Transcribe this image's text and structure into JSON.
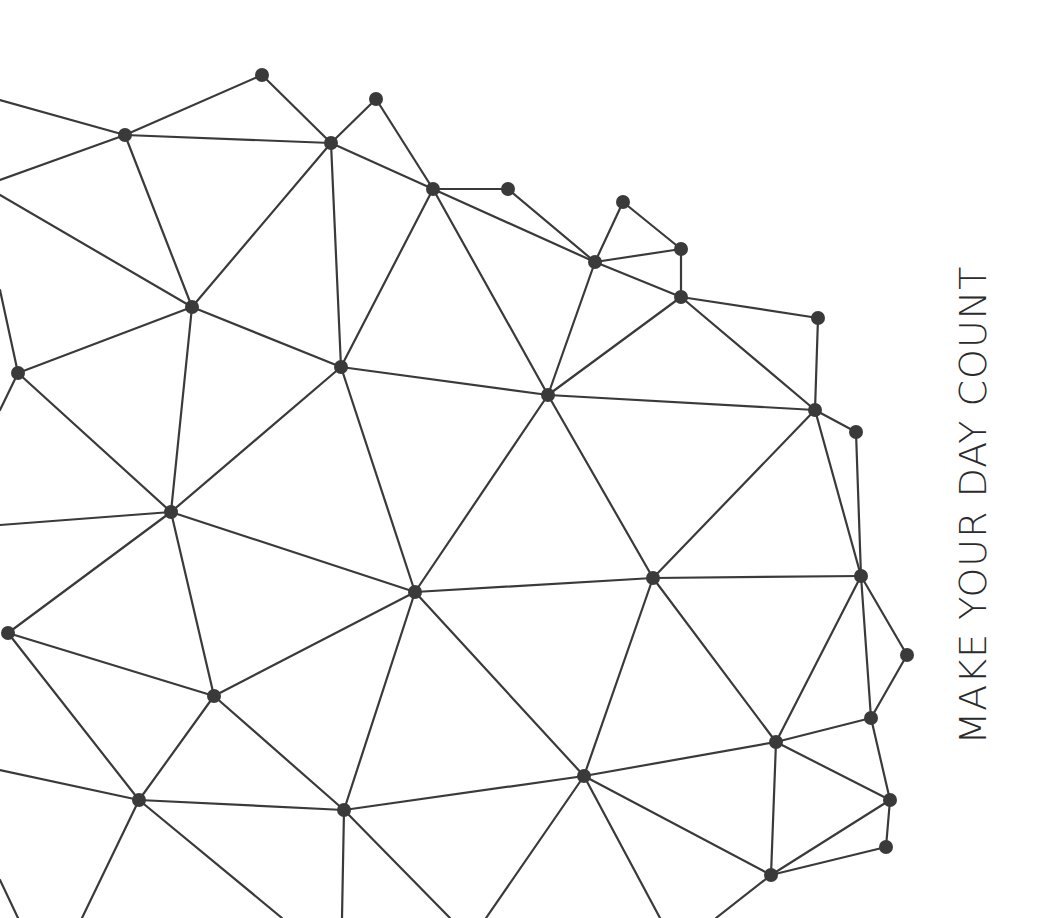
{
  "tagline": "MAKE YOUR DAY COUNT",
  "colors": {
    "background": "#ffffff",
    "line": "#3a3a3a",
    "node": "#3a3a3a",
    "text": "#2b2b2b"
  },
  "network": {
    "node_radius": 7,
    "nodes": {
      "A": [
        262,
        75
      ],
      "B": [
        125,
        135
      ],
      "C": [
        331,
        143
      ],
      "D": [
        376,
        99
      ],
      "E": [
        433,
        189
      ],
      "F": [
        508,
        189
      ],
      "G": [
        623,
        202
      ],
      "H": [
        595,
        262
      ],
      "I": [
        681,
        249
      ],
      "J": [
        681,
        297
      ],
      "K": [
        818,
        318
      ],
      "L": [
        192,
        307
      ],
      "M": [
        18,
        373
      ],
      "N": [
        341,
        367
      ],
      "O": [
        548,
        395
      ],
      "P": [
        815,
        410
      ],
      "Q": [
        856,
        432
      ],
      "R": [
        171,
        512
      ],
      "S": [
        415,
        592
      ],
      "T": [
        653,
        578
      ],
      "U": [
        861,
        576
      ],
      "V": [
        907,
        655
      ],
      "W": [
        8,
        633
      ],
      "X": [
        214,
        696
      ],
      "Y": [
        871,
        718
      ],
      "Z": [
        776,
        742
      ],
      "AA": [
        139,
        800
      ],
      "AB": [
        344,
        810
      ],
      "AC": [
        584,
        776
      ],
      "AD": [
        890,
        800
      ],
      "AE": [
        886,
        847
      ],
      "AF": [
        771,
        875
      ]
    },
    "offscreen_points": {
      "e1": [
        0,
        100
      ],
      "e2": [
        0,
        180
      ],
      "e3": [
        0,
        195
      ],
      "e4": [
        0,
        290
      ],
      "e5": [
        0,
        525
      ],
      "e6": [
        0,
        770
      ],
      "e7": [
        0,
        880
      ],
      "e8": [
        18,
        918
      ],
      "e9": [
        82,
        918
      ],
      "e10": [
        282,
        918
      ],
      "e11": [
        342,
        918
      ],
      "e12": [
        450,
        918
      ],
      "e13": [
        486,
        918
      ],
      "e14": [
        660,
        918
      ],
      "e15": [
        716,
        918
      ],
      "e16": [
        0,
        410
      ]
    },
    "edges": [
      [
        "e1",
        "B"
      ],
      [
        "e2",
        "B"
      ],
      [
        "e3",
        "L"
      ],
      [
        "B",
        "A"
      ],
      [
        "B",
        "C"
      ],
      [
        "B",
        "L"
      ],
      [
        "A",
        "C"
      ],
      [
        "C",
        "D"
      ],
      [
        "D",
        "E"
      ],
      [
        "C",
        "E"
      ],
      [
        "C",
        "L"
      ],
      [
        "C",
        "N"
      ],
      [
        "E",
        "F"
      ],
      [
        "E",
        "H"
      ],
      [
        "E",
        "N"
      ],
      [
        "E",
        "O"
      ],
      [
        "F",
        "H"
      ],
      [
        "G",
        "H"
      ],
      [
        "G",
        "I"
      ],
      [
        "H",
        "I"
      ],
      [
        "I",
        "J"
      ],
      [
        "H",
        "J"
      ],
      [
        "H",
        "O"
      ],
      [
        "J",
        "O"
      ],
      [
        "J",
        "K"
      ],
      [
        "J",
        "P"
      ],
      [
        "K",
        "P"
      ],
      [
        "P",
        "Q"
      ],
      [
        "O",
        "P"
      ],
      [
        "O",
        "N"
      ],
      [
        "L",
        "M"
      ],
      [
        "L",
        "N"
      ],
      [
        "L",
        "R"
      ],
      [
        "e4",
        "M"
      ],
      [
        "e16",
        "M"
      ],
      [
        "M",
        "R"
      ],
      [
        "N",
        "R"
      ],
      [
        "N",
        "S"
      ],
      [
        "O",
        "S"
      ],
      [
        "O",
        "T"
      ],
      [
        "P",
        "T"
      ],
      [
        "P",
        "U"
      ],
      [
        "Q",
        "U"
      ],
      [
        "e5",
        "R"
      ],
      [
        "R",
        "W"
      ],
      [
        "R",
        "S"
      ],
      [
        "R",
        "X"
      ],
      [
        "S",
        "T"
      ],
      [
        "S",
        "X"
      ],
      [
        "S",
        "AB"
      ],
      [
        "S",
        "AC"
      ],
      [
        "T",
        "U"
      ],
      [
        "T",
        "AC"
      ],
      [
        "T",
        "Z"
      ],
      [
        "U",
        "V"
      ],
      [
        "U",
        "Y"
      ],
      [
        "U",
        "Z"
      ],
      [
        "V",
        "Y"
      ],
      [
        "W",
        "X"
      ],
      [
        "W",
        "AA"
      ],
      [
        "e6",
        "AA"
      ],
      [
        "X",
        "AA"
      ],
      [
        "X",
        "AB"
      ],
      [
        "AA",
        "AB"
      ],
      [
        "AB",
        "AC"
      ],
      [
        "Z",
        "Y"
      ],
      [
        "Z",
        "AC"
      ],
      [
        "Z",
        "AD"
      ],
      [
        "Z",
        "AF"
      ],
      [
        "Y",
        "AD"
      ],
      [
        "AD",
        "AE"
      ],
      [
        "AD",
        "AF"
      ],
      [
        "AE",
        "AF"
      ],
      [
        "AC",
        "AF"
      ],
      [
        "e7",
        "e8"
      ],
      [
        "AA",
        "e9"
      ],
      [
        "AB",
        "e11"
      ],
      [
        "AB",
        "e12"
      ],
      [
        "AC",
        "e13"
      ],
      [
        "AC",
        "e14"
      ],
      [
        "AF",
        "e15"
      ],
      [
        "AA",
        "e10"
      ]
    ]
  }
}
